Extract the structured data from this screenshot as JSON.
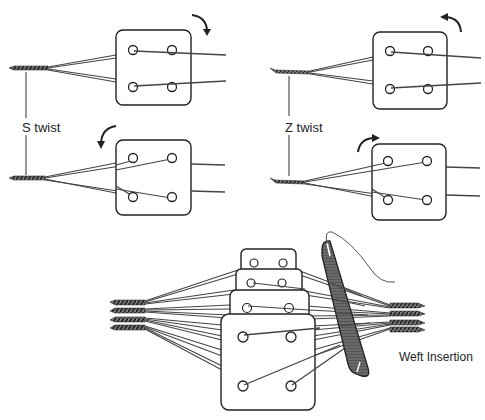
{
  "diagram": {
    "colors": {
      "line": "#222222",
      "thread": "#555555",
      "cord": "#444444",
      "shuttle": "#5a5a5a",
      "background": "#ffffff"
    },
    "labels": {
      "s_twist": "S twist",
      "z_twist": "Z twist",
      "weft_insertion": "Weft Insertion"
    },
    "panels": [
      {
        "id": "s-twist-top",
        "group": "S twist",
        "rotation": "clockwise",
        "arrow_icon": "clockwise-arrow-icon"
      },
      {
        "id": "s-twist-bottom",
        "group": "S twist",
        "rotation": "counterclockwise",
        "arrow_icon": "counterclockwise-arrow-icon"
      },
      {
        "id": "z-twist-top",
        "group": "Z twist",
        "rotation": "counterclockwise",
        "arrow_icon": "counterclockwise-arrow-icon"
      },
      {
        "id": "z-twist-bottom",
        "group": "Z twist",
        "rotation": "clockwise",
        "arrow_icon": "clockwise-arrow-icon"
      },
      {
        "id": "weft-insertion",
        "group": "Weft Insertion",
        "card_count": 4,
        "holes_per_card": 4
      }
    ]
  }
}
